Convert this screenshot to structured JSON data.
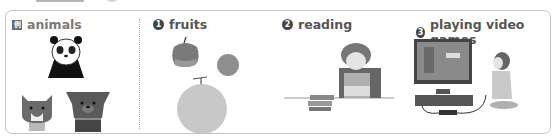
{
  "example": {
    "badge": "例",
    "label": "animals"
  },
  "items": [
    {
      "number": "1",
      "label": "fruits"
    },
    {
      "number": "2",
      "label": "reading"
    },
    {
      "number": "3",
      "label": "playing video games"
    }
  ],
  "colors": {
    "border": "#c4c4c4",
    "label_text": "#555555",
    "badge_bg": "#444444"
  }
}
